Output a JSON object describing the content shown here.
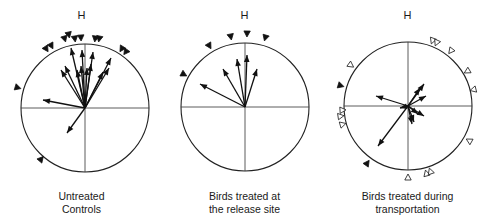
{
  "figure": {
    "panels": [
      {
        "heading": "H",
        "caption_line1": "Untreated",
        "caption_line2": "Controls",
        "center": [
          85,
          108
        ],
        "radius": 64,
        "vectors": [
          [
            -3,
            -58
          ],
          [
            -14,
            -60
          ],
          [
            8,
            -56
          ],
          [
            26,
            -50
          ],
          [
            -20,
            -42
          ],
          [
            -24,
            -38
          ],
          [
            -42,
            -8
          ],
          [
            -18,
            25
          ],
          [
            6,
            -44
          ],
          [
            -4,
            -42
          ],
          [
            2,
            -40
          ],
          [
            18,
            -36
          ],
          [
            24,
            -40
          ],
          [
            -8,
            -38
          ]
        ],
        "markers": [
          [
            -20,
            -68,
            "filled"
          ],
          [
            -10,
            -68,
            "filled"
          ],
          [
            -4,
            -69,
            "filled"
          ],
          [
            10,
            -68,
            "filled"
          ],
          [
            14,
            -68,
            "filled"
          ],
          [
            -38,
            -58,
            "filled"
          ],
          [
            -33,
            -61,
            "filled"
          ],
          [
            -16,
            -72,
            "filled"
          ],
          [
            36,
            -58,
            "filled"
          ],
          [
            40,
            -55,
            "filled"
          ],
          [
            -66,
            -20,
            "filled"
          ],
          [
            -43,
            50,
            "filled"
          ]
        ]
      },
      {
        "heading": "H",
        "caption_line1": "Birds treated at",
        "caption_line2": "the release site",
        "center": [
          245,
          107
        ],
        "radius": 64,
        "vectors": [
          [
            -45,
            -23
          ],
          [
            -22,
            -38
          ],
          [
            -8,
            -48
          ],
          [
            2,
            -52
          ],
          [
            12,
            -38
          ]
        ],
        "markers": [
          [
            -35,
            -60,
            "filled"
          ],
          [
            -14,
            -69,
            "filled"
          ],
          [
            2,
            -72,
            "filled"
          ],
          [
            20,
            -68,
            "filled"
          ],
          [
            -60,
            -32,
            "filled"
          ]
        ]
      },
      {
        "heading": "H",
        "caption_line1": "Birds treated during",
        "caption_line2": "transportation",
        "center": [
          408,
          106
        ],
        "radius": 64,
        "vectors": [
          [
            -32,
            -10
          ],
          [
            -30,
            40
          ],
          [
            16,
            -22
          ],
          [
            12,
            -18
          ],
          [
            18,
            -10
          ],
          [
            10,
            8
          ],
          [
            16,
            10
          ],
          [
            4,
            18
          ],
          [
            6,
            16
          ],
          [
            -8,
            2
          ]
        ],
        "markers": [
          [
            24,
            -64,
            "open"
          ],
          [
            28,
            -62,
            "open"
          ],
          [
            42,
            -54,
            "open"
          ],
          [
            58,
            -34,
            "open"
          ],
          [
            64,
            -16,
            "open"
          ],
          [
            60,
            34,
            "open"
          ],
          [
            18,
            66,
            "open"
          ],
          [
            22,
            64,
            "open"
          ],
          [
            0,
            70,
            "open"
          ],
          [
            -56,
            -40,
            "open"
          ],
          [
            -64,
            4,
            "open"
          ],
          [
            -66,
            10,
            "open"
          ],
          [
            -64,
            18,
            "open"
          ],
          [
            -66,
            -20,
            "filled"
          ],
          [
            -40,
            56,
            "filled"
          ]
        ]
      }
    ]
  }
}
